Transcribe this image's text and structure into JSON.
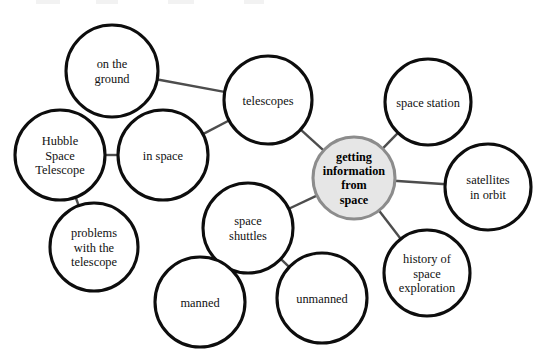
{
  "diagram": {
    "type": "concept-map",
    "canvas": {
      "width": 545,
      "height": 364,
      "background": "#ffffff"
    },
    "style": {
      "node_fill": "#ffffff",
      "node_stroke": "#0d0d0d",
      "center_fill": "#e6e6e6",
      "center_stroke": "#8c8c8c",
      "edge_color": "#4d4d4d",
      "text_color": "#111111"
    }
  },
  "nodes": [
    {
      "id": "center",
      "label": "getting information from space",
      "lines": [
        "getting",
        "information",
        "from",
        "space"
      ],
      "cx": 354,
      "cy": 178,
      "r": 41,
      "center": true
    },
    {
      "id": "telescopes",
      "label": "telescopes",
      "lines": [
        "telescopes"
      ],
      "cx": 268,
      "cy": 100,
      "r": 44,
      "center": false
    },
    {
      "id": "on-the-ground",
      "label": "on the ground",
      "lines": [
        "on the",
        "ground"
      ],
      "cx": 112,
      "cy": 71,
      "r": 46,
      "center": false
    },
    {
      "id": "in-space",
      "label": "in space",
      "lines": [
        "in space"
      ],
      "cx": 163,
      "cy": 155,
      "r": 45,
      "center": false
    },
    {
      "id": "hubble-space-telescope",
      "label": "Hubble Space Telescope",
      "lines": [
        "Hubble",
        "Space",
        "Telescope"
      ],
      "cx": 60,
      "cy": 155,
      "r": 45,
      "center": false
    },
    {
      "id": "problems-with-the-telescope",
      "label": "problems with the telescope",
      "lines": [
        "problems",
        "with the",
        "telescope"
      ],
      "cx": 94,
      "cy": 247,
      "r": 44,
      "center": false
    },
    {
      "id": "space-shuttles",
      "label": "space shuttles",
      "lines": [
        "space",
        "shuttles"
      ],
      "cx": 248,
      "cy": 228,
      "r": 45,
      "center": false
    },
    {
      "id": "manned",
      "label": "manned",
      "lines": [
        "manned"
      ],
      "cx": 200,
      "cy": 302,
      "r": 45,
      "center": false
    },
    {
      "id": "unmanned",
      "label": "unmanned",
      "lines": [
        "unmanned"
      ],
      "cx": 322,
      "cy": 298,
      "r": 45,
      "center": false
    },
    {
      "id": "space-station",
      "label": "space station",
      "lines": [
        "space station"
      ],
      "cx": 428,
      "cy": 102,
      "r": 43,
      "center": false
    },
    {
      "id": "satellites-in-orbit",
      "label": "satellites in orbit",
      "lines": [
        "satellites",
        "in orbit"
      ],
      "cx": 488,
      "cy": 187,
      "r": 43,
      "center": false
    },
    {
      "id": "history-of-space-exploration",
      "label": "history of space exploration",
      "lines": [
        "history of",
        "space",
        "exploration"
      ],
      "cx": 427,
      "cy": 273,
      "r": 43,
      "center": false
    }
  ],
  "edges": [
    {
      "from": "center",
      "to": "telescopes"
    },
    {
      "from": "center",
      "to": "space-station"
    },
    {
      "from": "center",
      "to": "satellites-in-orbit"
    },
    {
      "from": "center",
      "to": "history-of-space-exploration"
    },
    {
      "from": "center",
      "to": "space-shuttles"
    },
    {
      "from": "telescopes",
      "to": "on-the-ground"
    },
    {
      "from": "telescopes",
      "to": "in-space"
    },
    {
      "from": "in-space",
      "to": "hubble-space-telescope"
    },
    {
      "from": "hubble-space-telescope",
      "to": "problems-with-the-telescope"
    },
    {
      "from": "space-shuttles",
      "to": "manned"
    },
    {
      "from": "space-shuttles",
      "to": "unmanned"
    }
  ],
  "artifacts": [
    {
      "left": 36,
      "width": 24
    },
    {
      "left": 96,
      "width": 22
    },
    {
      "left": 168,
      "width": 26
    },
    {
      "left": 244,
      "width": 20
    }
  ]
}
